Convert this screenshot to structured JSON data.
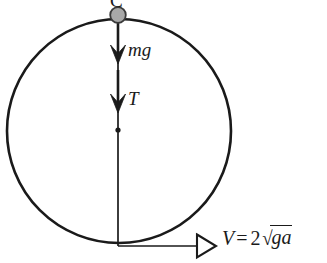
{
  "figure": {
    "type": "physics-free-body-diagram",
    "background_color": "#ffffff",
    "stroke_color": "#1a1a1a",
    "ball_fill_color": "#a8a8a8"
  },
  "labels": {
    "top_point": "C",
    "weight_force": "mg",
    "tension_force": "T"
  },
  "velocity": {
    "symbol": "V",
    "equals": "=",
    "coefficient": "2",
    "radical_sign": "√",
    "radicand": "ga"
  },
  "geometry": {
    "circle_center_x": 119,
    "circle_center_y": 131,
    "circle_radius": 112,
    "ball_center_x": 118,
    "ball_center_y": 15,
    "ball_radius": 8,
    "vertical_line_top_y": 15,
    "vertical_line_bottom_y": 246,
    "center_dot_y": 130,
    "mg_arrow_tip_y": 63,
    "tension_arrow_tip_y": 112,
    "velocity_arrow_y": 246,
    "velocity_arrow_start_x": 118,
    "velocity_arrow_tip_x": 216
  }
}
